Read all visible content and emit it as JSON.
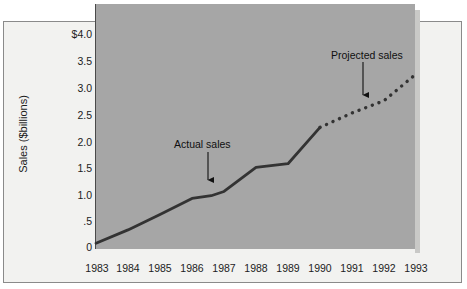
{
  "chart_data": {
    "type": "line",
    "title": "",
    "subtitle": "",
    "xlabel": "",
    "ylabel": "Sales ($billions)",
    "xlim": [
      1983,
      1993
    ],
    "ylim": [
      0,
      4.0
    ],
    "grid": false,
    "legend_position": "none",
    "x_ticklabels": [
      "1983",
      "1984",
      "1985",
      "1986",
      "1987",
      "1988",
      "1989",
      "1990",
      "1991",
      "1992",
      "1993"
    ],
    "y_ticklabels": [
      "$4.0",
      "3.5",
      "3.0",
      "2.5",
      "2.0",
      "1.5",
      "1.0",
      ".5",
      "0"
    ],
    "y_tickvalues": [
      4.0,
      3.5,
      3.0,
      2.5,
      2.0,
      1.5,
      1.0,
      0.5,
      0
    ],
    "x": [
      1983,
      1984,
      1985,
      1986,
      1987,
      1988,
      1989,
      1990,
      1991,
      1992,
      1993
    ],
    "series": [
      {
        "name": "Actual sales",
        "style": "solid",
        "x": [
          1983,
          1984,
          1985,
          1986,
          1986.6,
          1987,
          1988,
          1989,
          1990
        ],
        "values": [
          0.08,
          0.33,
          0.62,
          0.92,
          0.97,
          1.05,
          1.5,
          1.57,
          2.25
        ]
      },
      {
        "name": "Projected sales",
        "style": "dotted",
        "x": [
          1990,
          1991,
          1992,
          1993
        ],
        "values": [
          2.25,
          2.52,
          2.75,
          3.25
        ]
      }
    ],
    "annotations": [
      {
        "text": "Actual sales",
        "target_x": 1986.5,
        "target_y": 0.97,
        "arrow": "down"
      },
      {
        "text": "Projected sales",
        "target_x": 1991.4,
        "target_y": 2.62,
        "arrow": "down"
      }
    ],
    "colors": {
      "plot_background": "#a6a6a6",
      "panel_background": "#f2f2f0",
      "line": "#333333",
      "text": "#1c1c1c",
      "frame": "#8a8a8a"
    }
  }
}
